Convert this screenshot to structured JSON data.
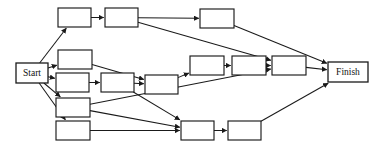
{
  "diagram": {
    "type": "activity-network-diagram",
    "canvas": {
      "width": 380,
      "height": 156,
      "background": "#ffffff"
    },
    "style": {
      "node_fill": "#ffffff",
      "node_stroke": "#1a1a1a",
      "edge_stroke": "#1a1a1a",
      "label_color": "#111111"
    },
    "node_count": 17,
    "edge_count": 22,
    "nodes": [
      {
        "id": "start",
        "label": "Start",
        "x": 16,
        "y": 63,
        "w": 32,
        "h": 20,
        "kind": "terminal"
      },
      {
        "id": "a1",
        "label": "",
        "x": 58,
        "y": 8,
        "w": 33,
        "h": 19,
        "kind": "task"
      },
      {
        "id": "a2",
        "label": "",
        "x": 105,
        "y": 8,
        "w": 33,
        "h": 19,
        "kind": "task"
      },
      {
        "id": "a3",
        "label": "",
        "x": 200,
        "y": 9,
        "w": 34,
        "h": 19,
        "kind": "task"
      },
      {
        "id": "b1",
        "label": "",
        "x": 58,
        "y": 50,
        "w": 34,
        "h": 19,
        "kind": "task"
      },
      {
        "id": "c1",
        "label": "",
        "x": 56,
        "y": 73,
        "w": 33,
        "h": 19,
        "kind": "task"
      },
      {
        "id": "c2",
        "label": "",
        "x": 101,
        "y": 73,
        "w": 33,
        "h": 19,
        "kind": "task"
      },
      {
        "id": "c3",
        "label": "",
        "x": 145,
        "y": 75,
        "w": 33,
        "h": 19,
        "kind": "task"
      },
      {
        "id": "m1",
        "label": "",
        "x": 190,
        "y": 56,
        "w": 34,
        "h": 19,
        "kind": "task"
      },
      {
        "id": "m2",
        "label": "",
        "x": 232,
        "y": 56,
        "w": 34,
        "h": 19,
        "kind": "task"
      },
      {
        "id": "m3",
        "label": "",
        "x": 272,
        "y": 56,
        "w": 34,
        "h": 19,
        "kind": "task"
      },
      {
        "id": "d1",
        "label": "",
        "x": 56,
        "y": 98,
        "w": 34,
        "h": 19,
        "kind": "task"
      },
      {
        "id": "e1",
        "label": "",
        "x": 56,
        "y": 121,
        "w": 34,
        "h": 19,
        "kind": "task"
      },
      {
        "id": "e2",
        "label": "",
        "x": 181,
        "y": 121,
        "w": 33,
        "h": 19,
        "kind": "task"
      },
      {
        "id": "e3",
        "label": "",
        "x": 228,
        "y": 121,
        "w": 33,
        "h": 19,
        "kind": "task"
      },
      {
        "id": "finish",
        "label": "Finish",
        "x": 328,
        "y": 62,
        "w": 40,
        "h": 20,
        "kind": "terminal"
      }
    ],
    "edges": [
      {
        "from": "start",
        "to": "a1"
      },
      {
        "from": "start",
        "to": "b1"
      },
      {
        "from": "start",
        "to": "c1"
      },
      {
        "from": "start",
        "to": "d1"
      },
      {
        "from": "start",
        "to": "e1"
      },
      {
        "from": "a1",
        "to": "a2"
      },
      {
        "from": "a2",
        "to": "a3"
      },
      {
        "from": "a2",
        "to": "m3"
      },
      {
        "from": "a3",
        "to": "finish"
      },
      {
        "from": "b1",
        "to": "c3"
      },
      {
        "from": "c1",
        "to": "c2"
      },
      {
        "from": "c2",
        "to": "c3"
      },
      {
        "from": "c2",
        "to": "e2"
      },
      {
        "from": "c3",
        "to": "m1"
      },
      {
        "from": "m1",
        "to": "m2"
      },
      {
        "from": "m2",
        "to": "m3"
      },
      {
        "from": "m3",
        "to": "finish"
      },
      {
        "from": "d1",
        "to": "e2"
      },
      {
        "from": "d1",
        "to": "m3"
      },
      {
        "from": "e1",
        "to": "e2"
      },
      {
        "from": "e2",
        "to": "e3"
      },
      {
        "from": "e3",
        "to": "finish"
      }
    ]
  }
}
